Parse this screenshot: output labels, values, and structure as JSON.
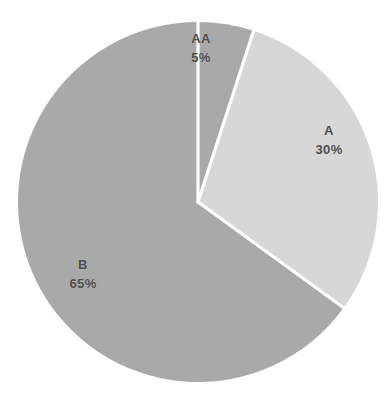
{
  "chart_data": {
    "type": "pie",
    "title": "",
    "subtitle": "",
    "xlabel": "",
    "ylabel": "",
    "legend": "none",
    "grid": false,
    "labels_inside_slices": true,
    "start_angle_deg": 0,
    "direction": "clockwise",
    "categories": [
      "AA",
      "A",
      "B"
    ],
    "values": [
      5,
      30,
      65
    ],
    "value_unit": "%",
    "slices": [
      {
        "name": "AA",
        "value": 5,
        "value_label": "5%",
        "color": "#a9a9a9",
        "start_angle_deg": 0,
        "end_angle_deg": 18
      },
      {
        "name": "A",
        "value": 30,
        "value_label": "30%",
        "color": "#d7d7d7",
        "start_angle_deg": 18,
        "end_angle_deg": 126
      },
      {
        "name": "B",
        "value": 65,
        "value_label": "65%",
        "color": "#a9a9a9",
        "start_angle_deg": 126,
        "end_angle_deg": 360
      }
    ]
  },
  "figure": {
    "background_color": "#ffffff",
    "separator_color": "#ffffff",
    "label_color": "#4c4c4c",
    "center_x": 198,
    "center_y": 202,
    "radius": 180
  }
}
